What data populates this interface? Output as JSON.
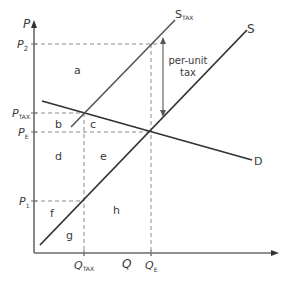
{
  "diagram": {
    "axes": {
      "y_label": "P",
      "x_label": "Q"
    },
    "price_labels": {
      "p2": {
        "main": "P",
        "sub": "2"
      },
      "ptax": {
        "main": "P",
        "sub": "TAX"
      },
      "pe": {
        "main": "P",
        "sub": "E"
      },
      "p1": {
        "main": "P",
        "sub": "1"
      }
    },
    "quantity_labels": {
      "qtax": {
        "main": "Q",
        "sub": "TAX"
      },
      "qe": {
        "main": "Q",
        "sub": "E"
      }
    },
    "curves": {
      "supply": {
        "label": "S"
      },
      "supply_tax": {
        "main": "S",
        "sub": "TAX"
      },
      "demand": {
        "label": "D"
      }
    },
    "annotation": {
      "line1": "per-unit",
      "line2": "tax"
    },
    "regions": {
      "a": "a",
      "b": "b",
      "c": "c",
      "d": "d",
      "e": "e",
      "f": "f",
      "g": "g",
      "h": "h"
    },
    "colors": {
      "axis": "#6a6a6a",
      "curve": "#333333",
      "supply_tax": "#555555",
      "dashed": "#8a8a8a",
      "text": "#3a3a3a"
    }
  }
}
